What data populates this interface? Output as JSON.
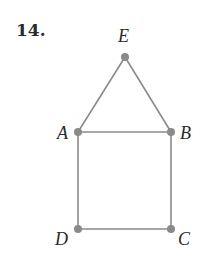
{
  "problem": {
    "number": "14."
  },
  "graph": {
    "nodes": [
      {
        "id": "E",
        "label": "E",
        "x": 125,
        "y": 57
      },
      {
        "id": "A",
        "label": "A",
        "x": 78,
        "y": 132
      },
      {
        "id": "B",
        "label": "B",
        "x": 171,
        "y": 132
      },
      {
        "id": "D",
        "label": "D",
        "x": 78,
        "y": 229
      },
      {
        "id": "C",
        "label": "C",
        "x": 171,
        "y": 229
      }
    ],
    "edges": [
      [
        "E",
        "A"
      ],
      [
        "E",
        "B"
      ],
      [
        "A",
        "B"
      ],
      [
        "A",
        "D"
      ],
      [
        "B",
        "C"
      ],
      [
        "D",
        "C"
      ]
    ],
    "colors": {
      "edge": "#8a8a8a",
      "node": "#8a8a8a",
      "text": "#2a2a2a"
    }
  }
}
